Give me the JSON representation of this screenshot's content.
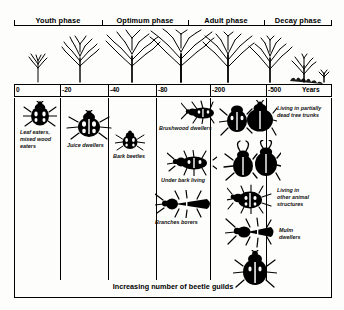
{
  "figure": {
    "bottom_caption": "Increasing number of beetle guilds"
  },
  "phases": [
    {
      "label": "Youth phase",
      "left": 0,
      "width": 88
    },
    {
      "label": "Optimum phase",
      "left": 88,
      "width": 86
    },
    {
      "label": "Adult phase",
      "left": 174,
      "width": 76
    },
    {
      "label": "Decay phase",
      "left": 250,
      "width": 68
    }
  ],
  "axis": {
    "unit_label": "Years",
    "ticks": [
      {
        "label": "0",
        "pos": 0
      },
      {
        "label": "-20",
        "pos": 46
      },
      {
        "label": "-40",
        "pos": 94
      },
      {
        "label": "-80",
        "pos": 142
      },
      {
        "label": "-200",
        "pos": 196
      },
      {
        "label": "-500",
        "pos": 252
      },
      {
        "label": "",
        "pos": 318
      }
    ]
  },
  "trees": [
    {
      "name": "sapling",
      "x": 18,
      "scale": 0.42
    },
    {
      "name": "young-tree",
      "x": 62,
      "scale": 0.68
    },
    {
      "name": "maturing-tree",
      "x": 112,
      "scale": 0.86
    },
    {
      "name": "mature-tree",
      "x": 160,
      "scale": 1.0
    },
    {
      "name": "old-tree",
      "x": 206,
      "scale": 0.97
    },
    {
      "name": "senescent-tree",
      "x": 248,
      "scale": 0.88
    },
    {
      "name": "decaying-tree",
      "x": 283,
      "scale": 0.62
    },
    {
      "name": "stump-remnant",
      "x": 306,
      "scale": 0.3
    }
  ],
  "guilds": [
    {
      "id": "leaf-eaters",
      "label": "Leaf eaters,\nmixed wood\neaters",
      "beetle": "ground-beetle",
      "beetle_x": 16,
      "beetle_y": 4,
      "beetle_w": 34,
      "beetle_h": 26,
      "cap_x": 13,
      "cap_y": 30
    },
    {
      "id": "juice-dwellers",
      "label": "Juice dwellers",
      "beetle": "spotted-beetle",
      "beetle_x": 56,
      "beetle_y": 16,
      "beetle_w": 44,
      "beetle_h": 28,
      "cap_x": 56,
      "cap_y": 44
    },
    {
      "id": "bark-beetles",
      "label": "Bark beetles",
      "beetle": "small-bark-beetle",
      "beetle_x": 104,
      "beetle_y": 34,
      "beetle_w": 28,
      "beetle_h": 20,
      "cap_x": 100,
      "cap_y": 54
    },
    {
      "id": "brushwood-dwellers",
      "label": "Brushwood dwellers",
      "beetle": "longhorn-small",
      "beetle_x": 168,
      "beetle_y": 6,
      "beetle_w": 38,
      "beetle_h": 22,
      "cap_x": 148,
      "cap_y": 28
    },
    {
      "id": "under-bark-living",
      "label": "Under bark living",
      "beetle": "flat-beetle",
      "beetle_x": 152,
      "beetle_y": 58,
      "beetle_w": 46,
      "beetle_h": 24,
      "cap_x": 152,
      "cap_y": 82
    },
    {
      "id": "branches-borers",
      "label": "Branches borers",
      "beetle": "click-beetle",
      "beetle_x": 142,
      "beetle_y": 96,
      "beetle_w": 54,
      "beetle_h": 26,
      "cap_x": 146,
      "cap_y": 122
    },
    {
      "id": "living-partially-dead-trunks",
      "label": "Living in partially\ndead tree trunks",
      "beetle": "large-dark-beetle",
      "beetle_x": 212,
      "beetle_y": 2,
      "beetle_w": 54,
      "beetle_h": 36,
      "cap_x": 258,
      "cap_y": 8
    },
    {
      "id": "stag-beetle-group",
      "label": "",
      "beetle": "stag-beetle",
      "beetle_x": 214,
      "beetle_y": 44,
      "beetle_w": 54,
      "beetle_h": 40,
      "cap_x": 0,
      "cap_y": 0
    },
    {
      "id": "living-other-animal-structures",
      "label": "Living in\nother animal\nstructures",
      "beetle": "hairy-beetle",
      "beetle_x": 218,
      "beetle_y": 88,
      "beetle_w": 42,
      "beetle_h": 28,
      "cap_x": 262,
      "cap_y": 90
    },
    {
      "id": "mulm-dwellers",
      "label": "Mulm\ndwellers",
      "beetle": "long-antenna-beetle",
      "beetle_x": 216,
      "beetle_y": 122,
      "beetle_w": 46,
      "beetle_h": 30,
      "cap_x": 264,
      "cap_y": 130
    },
    {
      "id": "mulm-dwellers-second",
      "label": "",
      "beetle": "broad-beetle",
      "beetle_x": 224,
      "beetle_y": 156,
      "beetle_w": 40,
      "beetle_h": 34,
      "cap_x": 0,
      "cap_y": 0
    }
  ],
  "dividers": [
    46,
    94,
    142,
    196,
    252
  ]
}
